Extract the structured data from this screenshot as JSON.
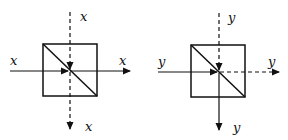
{
  "diagram": {
    "left": {
      "labels": {
        "top_input": "x",
        "left_input": "x",
        "right_output": "x",
        "bottom_output": "x"
      },
      "solid_path": "horizontal",
      "dashed_path": "vertical"
    },
    "right": {
      "labels": {
        "top_input": "y",
        "left_input": "y",
        "right_output": "y",
        "bottom_output": "y"
      },
      "solid_path": "left-in, bottom-out",
      "dashed_path": "top-in, right-out"
    },
    "colors": {
      "stroke": "#111111",
      "background": "#ffffff"
    }
  }
}
